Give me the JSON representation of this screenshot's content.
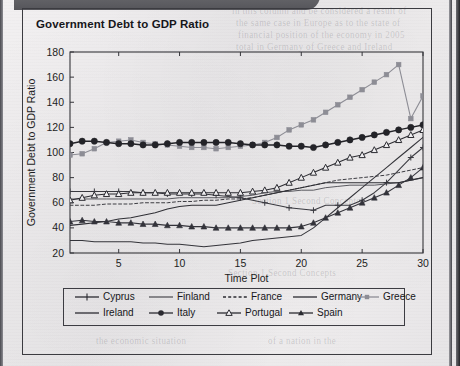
{
  "figure": {
    "title": "Government Debt to GDP Ratio"
  },
  "ghost_text": [
    {
      "t": "in this column and be considered a result of",
      "x": 232,
      "y": 6
    },
    {
      "t": "the same case in Europe as to the state of",
      "x": 236,
      "y": 18
    },
    {
      "t": "financial position of the economy in 2005",
      "x": 238,
      "y": 30
    },
    {
      "t": "total in Germany of Greece and Ireland",
      "x": 236,
      "y": 42
    },
    {
      "t": "Section 1 Second Concepts",
      "x": 252,
      "y": 196
    },
    {
      "t": "Section 1 Second Concepts",
      "x": 228,
      "y": 268
    },
    {
      "t": "the economic situation",
      "x": 96,
      "y": 336
    },
    {
      "t": "of a nation in the",
      "x": 268,
      "y": 336
    }
  ],
  "chart_data": {
    "type": "line",
    "title": "Government Debt to GDP Ratio",
    "xlabel": "Time Plot",
    "ylabel": "Government Debt to GDP Ratio",
    "xlim": [
      1,
      30
    ],
    "ylim": [
      20,
      180
    ],
    "xticks": [
      5,
      10,
      15,
      20,
      25,
      30
    ],
    "yticks": [
      20,
      40,
      60,
      80,
      100,
      120,
      140,
      160,
      180
    ],
    "grid": false,
    "legend_position": "below-plot",
    "x": [
      1,
      2,
      3,
      4,
      5,
      6,
      7,
      8,
      9,
      10,
      11,
      12,
      13,
      14,
      15,
      16,
      17,
      18,
      19,
      20,
      21,
      22,
      23,
      24,
      25,
      26,
      27,
      28,
      29,
      30
    ],
    "series": [
      {
        "name": "Cyprus",
        "style": "line-plus-marker",
        "marker": "plus",
        "color": "#3a3a40",
        "values": [
          69,
          69,
          69,
          69,
          69,
          69,
          68,
          68,
          67,
          67,
          67,
          67,
          66,
          65,
          64,
          62,
          60,
          58,
          56,
          55,
          54,
          58,
          58,
          58,
          62,
          68,
          76,
          86,
          96,
          104
        ]
      },
      {
        "name": "Finland",
        "style": "solid-thin",
        "marker": "none",
        "color": "#4a4a50",
        "values": [
          63,
          63,
          63,
          63,
          63,
          63,
          63,
          63,
          63,
          64,
          64,
          64,
          64,
          64,
          65,
          66,
          68,
          69,
          69,
          70,
          70,
          72,
          73,
          74,
          74,
          74,
          75,
          76,
          78,
          80
        ]
      },
      {
        "name": "France",
        "style": "dashed",
        "marker": "none",
        "color": "#3c3c42",
        "values": [
          58,
          58,
          58,
          59,
          59,
          59,
          60,
          60,
          60,
          61,
          61,
          62,
          62,
          63,
          63,
          64,
          66,
          68,
          70,
          72,
          74,
          76,
          78,
          79,
          80,
          81,
          82,
          84,
          86,
          88
        ]
      },
      {
        "name": "Germany",
        "style": "solid",
        "marker": "none",
        "color": "#2f2f35",
        "values": [
          42,
          43,
          44,
          45,
          47,
          48,
          50,
          52,
          55,
          57,
          58,
          58,
          58,
          60,
          62,
          64,
          66,
          68,
          70,
          72,
          74,
          76,
          76,
          76,
          76,
          76,
          76,
          76,
          78,
          80
        ]
      },
      {
        "name": "Greece",
        "style": "line-square-marker",
        "marker": "square",
        "color": "#8d8d95",
        "values": [
          98,
          99,
          103,
          108,
          109,
          110,
          108,
          107,
          106,
          105,
          104,
          104,
          103,
          104,
          105,
          106,
          108,
          112,
          118,
          122,
          126,
          132,
          138,
          144,
          150,
          156,
          162,
          170,
          127,
          145
        ]
      },
      {
        "name": "Ireland",
        "style": "solid",
        "marker": "none",
        "color": "#34343a",
        "values": [
          30,
          30,
          29,
          29,
          29,
          29,
          28,
          28,
          27,
          27,
          26,
          25,
          26,
          27,
          28,
          30,
          31,
          32,
          33,
          34,
          40,
          48,
          56,
          64,
          72,
          80,
          88,
          96,
          104,
          112
        ]
      },
      {
        "name": "Italy",
        "style": "line-circle-marker",
        "marker": "circle",
        "color": "#232328",
        "values": [
          107,
          109,
          109,
          108,
          107,
          107,
          106,
          106,
          107,
          108,
          108,
          108,
          108,
          108,
          107,
          106,
          106,
          106,
          105,
          105,
          104,
          106,
          108,
          110,
          112,
          114,
          116,
          118,
          120,
          122
        ]
      },
      {
        "name": "Portugal",
        "style": "line-triangle-open",
        "marker": "triangle-open",
        "color": "#2b2b31",
        "values": [
          62,
          64,
          66,
          67,
          67,
          68,
          68,
          68,
          68,
          68,
          68,
          68,
          68,
          68,
          68,
          69,
          70,
          72,
          76,
          80,
          84,
          88,
          92,
          96,
          98,
          102,
          106,
          110,
          114,
          118
        ]
      },
      {
        "name": "Spain",
        "style": "line-triangle-filled",
        "marker": "triangle-filled",
        "color": "#33333a",
        "values": [
          45,
          46,
          45,
          45,
          44,
          44,
          43,
          43,
          42,
          42,
          41,
          41,
          40,
          40,
          40,
          40,
          40,
          40,
          40,
          41,
          44,
          48,
          52,
          56,
          60,
          64,
          68,
          74,
          80,
          88
        ]
      }
    ]
  },
  "legend": {
    "row1": [
      {
        "label": "Cyprus",
        "key": "line-plus-marker"
      },
      {
        "label": "Finland",
        "key": "solid-thin"
      },
      {
        "label": "France",
        "key": "dashed"
      },
      {
        "label": "Germany",
        "key": "solid"
      },
      {
        "label": "Greece",
        "key": "line-square-marker"
      }
    ],
    "row2": [
      {
        "label": "Ireland",
        "key": "solid"
      },
      {
        "label": "Italy",
        "key": "line-circle-marker"
      },
      {
        "label": "Portugal",
        "key": "line-triangle-open"
      },
      {
        "label": "Spain",
        "key": "line-triangle-filled"
      }
    ]
  }
}
